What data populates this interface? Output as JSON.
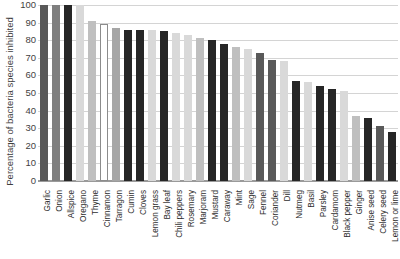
{
  "chart_data": {
    "type": "bar",
    "title": "",
    "xlabel": "",
    "ylabel": "Percentage of bacteria species inhibited",
    "ylim": [
      0,
      100
    ],
    "ytick_labels": [
      "100",
      "90",
      "80",
      "70",
      "60",
      "50",
      "40",
      "30",
      "20",
      "10",
      "0"
    ],
    "ytick_values": [
      100,
      90,
      80,
      70,
      60,
      50,
      40,
      30,
      20,
      10,
      0
    ],
    "grid": true,
    "legend": "none",
    "categories": [
      "Garlic",
      "Onion",
      "Allspice",
      "Oregano",
      "Thyme",
      "Cinnamon",
      "Tarragon",
      "Cumin",
      "Cloves",
      "Lemon grass",
      "Bay leaf",
      "Chili peppers",
      "Rosemary",
      "Marjoram",
      "Mustard",
      "Caraway",
      "Mint",
      "Sage",
      "Fennel",
      "Coriander",
      "Dill",
      "Nutmeg",
      "Basil",
      "Parsley",
      "Cardamom",
      "Black pepper",
      "Ginger",
      "Anise seed",
      "Celery seed",
      "Lemon or lime"
    ],
    "values": [
      100,
      100,
      100,
      100,
      91,
      89,
      87,
      86,
      86,
      86,
      85,
      84,
      83,
      81,
      80,
      78,
      76,
      75,
      73,
      69,
      68,
      57,
      56,
      54,
      52,
      51,
      37,
      36,
      31,
      28
    ],
    "bar_colors": [
      "#595959",
      "#7f7f7f",
      "#262626",
      "#d9d9d9",
      "#bfbfbf",
      "#ffffff",
      "#a6a6a6",
      "#262626",
      "#262626",
      "#d9d9d9",
      "#262626",
      "#d9d9d9",
      "#d9d9d9",
      "#bfbfbf",
      "#262626",
      "#262626",
      "#bfbfbf",
      "#d9d9d9",
      "#595959",
      "#595959",
      "#d9d9d9",
      "#262626",
      "#d9d9d9",
      "#262626",
      "#262626",
      "#d9d9d9",
      "#bfbfbf",
      "#262626",
      "#595959",
      "#262626"
    ],
    "outlined_bars": [
      "Cinnamon"
    ]
  }
}
